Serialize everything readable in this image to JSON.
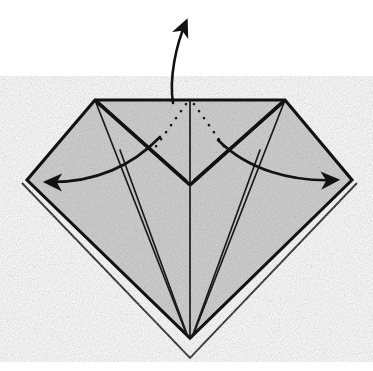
{
  "figure": {
    "domain": "Diagram",
    "caption": "",
    "background_color": "#ffffff",
    "paper_color": "#c9c9c9",
    "line_color": "#111111",
    "canvas": {
      "width": 373,
      "height": 371
    }
  },
  "geometry": {
    "top_edge": {
      "left": [
        95,
        100
      ],
      "right": [
        285,
        100
      ]
    },
    "left_vertex": [
      27,
      180
    ],
    "right_vertex": [
      352,
      180
    ],
    "bottom_vertex_gray": [
      190,
      338
    ],
    "bottom_vertex_outer": [
      190,
      358
    ],
    "center_v_vertex": [
      190,
      185
    ],
    "notes": "Symmetric diamond silhouette with flat top edge; inner flaps meet at center."
  },
  "shapes": {
    "body_outline": "M 95,100 L 285,100 L 352,180 L 190,338 L 27,180 Z",
    "under_layer_left": "M 27,180 L 190,338 L 190,358 L 22,183 Z",
    "under_layer_right": "M 352,180 L 190,338 L 190,358 L 357,183 Z",
    "center_spine": "M 190,100 L 190,338",
    "left_flap_outer": "M 95,100 L 190,185",
    "left_flap_inner": "M 95,100 L 184,182",
    "right_flap_outer": "M 285,100 L 190,185",
    "right_flap_inner": "M 285,100 L 196,182",
    "left_crease_long": "M 95,100 L 186,333",
    "right_crease_long": "M 285,100 L 194,333",
    "left_inner_crease": "M 120,150 L 188,337",
    "right_inner_crease": "M 260,150 L 192,337"
  },
  "hidden_folds": {
    "label": "hidden-fold-dotted-lines",
    "left_dotted": "M 186,104 L 152,152",
    "right_dotted": "M 194,104 L 228,152"
  },
  "arrows": [
    {
      "name": "up-arrow",
      "label": "fold up / pull up",
      "direction": "up",
      "path": "M 173,103 C 169,78 176,45 186,22",
      "head_at": [
        188,
        5
      ],
      "head_angle_deg": -68
    },
    {
      "name": "left-arrow",
      "label": "spread left",
      "direction": "left",
      "path": "M 160,137 C 130,168 92,183 47,182",
      "head_at": [
        38,
        182
      ],
      "head_angle_deg": 182
    },
    {
      "name": "right-arrow",
      "label": "spread right",
      "direction": "right",
      "path": "M 218,140 C 248,170 292,182 336,180",
      "head_at": [
        345,
        180
      ],
      "head_angle_deg": -2
    }
  ],
  "legend": {
    "solid_line": "visible edge or crease",
    "dotted_line": "hidden edge behind layer",
    "arrow": "direction of fold / movement"
  }
}
